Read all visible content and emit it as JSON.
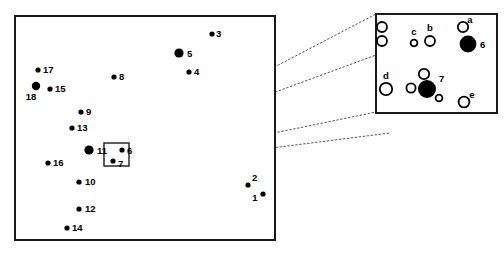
{
  "figure": {
    "background_color": "#ffffff",
    "frame_color": "#1a1a1a",
    "marker_fill_color": "#000000",
    "leader_color": "#555555"
  },
  "main_panel": {
    "name": "main-map-panel",
    "frame": {
      "x": 15,
      "y": 16,
      "width": 260,
      "height": 224
    },
    "points": [
      {
        "label": "1",
        "cx": 263,
        "cy": 194,
        "r": 2.6,
        "style": "filled",
        "lx": 255,
        "ly": 201,
        "anchor": "middle"
      },
      {
        "label": "2",
        "cx": 248,
        "cy": 185,
        "r": 2.6,
        "style": "filled",
        "lx": 252,
        "ly": 181,
        "anchor": "start"
      },
      {
        "label": "3",
        "cx": 212,
        "cy": 34,
        "r": 2.6,
        "style": "filled",
        "lx": 216,
        "ly": 37,
        "anchor": "start"
      },
      {
        "label": "4",
        "cx": 189,
        "cy": 72,
        "r": 2.6,
        "style": "filled",
        "lx": 194,
        "ly": 75,
        "anchor": "start"
      },
      {
        "label": "5",
        "cx": 179,
        "cy": 53,
        "r": 4.6,
        "style": "filled",
        "lx": 187,
        "ly": 57,
        "anchor": "start"
      },
      {
        "label": "6",
        "cx": 122,
        "cy": 150,
        "r": 2.6,
        "style": "filled",
        "lx": 127,
        "ly": 154,
        "anchor": "start"
      },
      {
        "label": "7",
        "cx": 113,
        "cy": 161,
        "r": 2.6,
        "style": "filled",
        "lx": 118,
        "ly": 167,
        "anchor": "start"
      },
      {
        "label": "8",
        "cx": 114,
        "cy": 77,
        "r": 2.6,
        "style": "filled",
        "lx": 119,
        "ly": 80,
        "anchor": "start"
      },
      {
        "label": "9",
        "cx": 81,
        "cy": 112,
        "r": 2.6,
        "style": "filled",
        "lx": 86,
        "ly": 115,
        "anchor": "start"
      },
      {
        "label": "10",
        "cx": 79,
        "cy": 182,
        "r": 2.6,
        "style": "filled",
        "lx": 85,
        "ly": 185,
        "anchor": "start"
      },
      {
        "label": "11",
        "cx": 89,
        "cy": 150,
        "r": 4.6,
        "style": "filled",
        "lx": 97,
        "ly": 154,
        "anchor": "start"
      },
      {
        "label": "12",
        "cx": 79,
        "cy": 209,
        "r": 2.6,
        "style": "filled",
        "lx": 85,
        "ly": 212,
        "anchor": "start"
      },
      {
        "label": "13",
        "cx": 72,
        "cy": 128,
        "r": 2.6,
        "style": "filled",
        "lx": 77,
        "ly": 131,
        "anchor": "start"
      },
      {
        "label": "14",
        "cx": 67,
        "cy": 228,
        "r": 2.6,
        "style": "filled",
        "lx": 72,
        "ly": 231,
        "anchor": "start"
      },
      {
        "label": "15",
        "cx": 50,
        "cy": 89,
        "r": 2.6,
        "style": "filled",
        "lx": 55,
        "ly": 92,
        "anchor": "start"
      },
      {
        "label": "16",
        "cx": 48,
        "cy": 163,
        "r": 2.6,
        "style": "filled",
        "lx": 53,
        "ly": 166,
        "anchor": "start"
      },
      {
        "label": "17",
        "cx": 38,
        "cy": 70,
        "r": 2.6,
        "style": "filled",
        "lx": 43,
        "ly": 73,
        "anchor": "start"
      },
      {
        "label": "18",
        "cx": 36,
        "cy": 86,
        "r": 4.2,
        "style": "filled",
        "lx": 31,
        "ly": 100,
        "anchor": "middle"
      }
    ],
    "zoom_box": {
      "x": 104,
      "y": 143,
      "width": 25,
      "height": 23
    }
  },
  "inset_panel": {
    "name": "magnified-inset-panel",
    "frame": {
      "x": 376,
      "y": 14,
      "width": 121,
      "height": 99
    },
    "points": [
      {
        "label": "",
        "cx": 382,
        "cy": 27,
        "r": 5.0,
        "style": "open",
        "lx": 0,
        "ly": 0,
        "anchor": "middle"
      },
      {
        "label": "",
        "cx": 382,
        "cy": 41,
        "r": 5.0,
        "style": "open",
        "lx": 0,
        "ly": 0,
        "anchor": "middle"
      },
      {
        "label": "c",
        "cx": 414,
        "cy": 43,
        "r": 3.4,
        "style": "open",
        "lx": 414,
        "ly": 35,
        "anchor": "middle"
      },
      {
        "label": "b",
        "cx": 430,
        "cy": 41,
        "r": 5.0,
        "style": "open",
        "lx": 430,
        "ly": 31,
        "anchor": "middle"
      },
      {
        "label": "a",
        "cx": 463,
        "cy": 27,
        "r": 5.2,
        "style": "open",
        "lx": 470,
        "ly": 23,
        "anchor": "middle"
      },
      {
        "label": "6",
        "cx": 468,
        "cy": 44,
        "r": 8.4,
        "style": "filled",
        "lx": 480,
        "ly": 48,
        "anchor": "start"
      },
      {
        "label": "d",
        "cx": 386,
        "cy": 89,
        "r": 6.2,
        "style": "open",
        "lx": 386,
        "ly": 79,
        "anchor": "middle"
      },
      {
        "label": "",
        "cx": 424,
        "cy": 74,
        "r": 5.2,
        "style": "open",
        "lx": 0,
        "ly": 0,
        "anchor": "middle"
      },
      {
        "label": "",
        "cx": 411,
        "cy": 88,
        "r": 4.6,
        "style": "open",
        "lx": 0,
        "ly": 0,
        "anchor": "middle"
      },
      {
        "label": "7",
        "cx": 427,
        "cy": 89,
        "r": 9.0,
        "style": "filled",
        "lx": 439,
        "ly": 82,
        "anchor": "start"
      },
      {
        "label": "",
        "cx": 439,
        "cy": 98,
        "r": 3.4,
        "style": "open",
        "lx": 0,
        "ly": 0,
        "anchor": "middle"
      },
      {
        "label": "e",
        "cx": 464,
        "cy": 102,
        "r": 5.4,
        "style": "open",
        "lx": 472,
        "ly": 98,
        "anchor": "middle"
      }
    ]
  },
  "leader_lines": [
    {
      "name": "leader-top",
      "x1": 129,
      "y1": 143,
      "x2": 376,
      "y2": 14
    },
    {
      "name": "leader-upper-mid",
      "x1": 129,
      "y1": 146,
      "x2": 376,
      "y2": 55
    },
    {
      "name": "leader-lower-mid",
      "x1": 129,
      "y1": 163,
      "x2": 376,
      "y2": 112
    },
    {
      "name": "leader-bottom",
      "x1": 129,
      "y1": 166,
      "x2": 390,
      "y2": 133
    }
  ]
}
